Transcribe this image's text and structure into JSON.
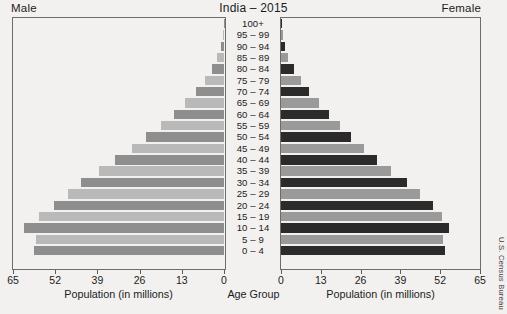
{
  "chart_title": "India – 2015",
  "left_corner_label": "Male",
  "right_corner_label": "Female",
  "source": "U.S. Census Bureau",
  "axis": {
    "male_title": "Population (in millions)",
    "female_title": "Population (in millions)",
    "center_title": "Age Group",
    "male_ticks": [
      "65",
      "52",
      "39",
      "26",
      "13",
      "0"
    ],
    "female_ticks": [
      "0",
      "13",
      "26",
      "39",
      "52",
      "65"
    ]
  },
  "chart_data": {
    "type": "bar",
    "subtype": "population-pyramid",
    "title": "India – 2015",
    "xlabel": "Population (in millions)",
    "ylabel": "Age Group",
    "xlim": [
      0,
      65
    ],
    "xticks": [
      0,
      13,
      26,
      39,
      52,
      65
    ],
    "grid": false,
    "legend": [
      "Male",
      "Female"
    ],
    "legend_position": "top-corners",
    "categories": [
      "100+",
      "95 – 99",
      "90 – 94",
      "85 – 89",
      "80 – 84",
      "75 – 79",
      "70 – 74",
      "65 – 69",
      "60 – 64",
      "55 – 59",
      "50 – 54",
      "45 – 49",
      "40 – 44",
      "35 – 39",
      "30 – 34",
      "25 – 29",
      "20 – 24",
      "15 – 19",
      "10 – 14",
      "5 – 9",
      "0 – 4"
    ],
    "series": [
      {
        "name": "Male",
        "side": "left",
        "color_light": "#b9b9b9",
        "color_dark": "#8e8e8e",
        "values": [
          0.1,
          0.4,
          1.0,
          2.2,
          3.8,
          6.0,
          8.6,
          12.0,
          15.5,
          19.5,
          24.0,
          28.5,
          33.5,
          38.5,
          44.0,
          48.0,
          52.5,
          57.0,
          61.5,
          58.0,
          58.5
        ]
      },
      {
        "name": "Female",
        "side": "right",
        "color_light": "#9a9a9a",
        "color_dark": "#2b2b2b",
        "values": [
          0.1,
          0.5,
          1.2,
          2.4,
          4.2,
          6.6,
          9.3,
          12.4,
          15.8,
          19.2,
          23.0,
          27.0,
          31.5,
          36.0,
          41.0,
          45.5,
          49.5,
          52.5,
          55.0,
          53.0,
          53.5
        ]
      }
    ]
  }
}
